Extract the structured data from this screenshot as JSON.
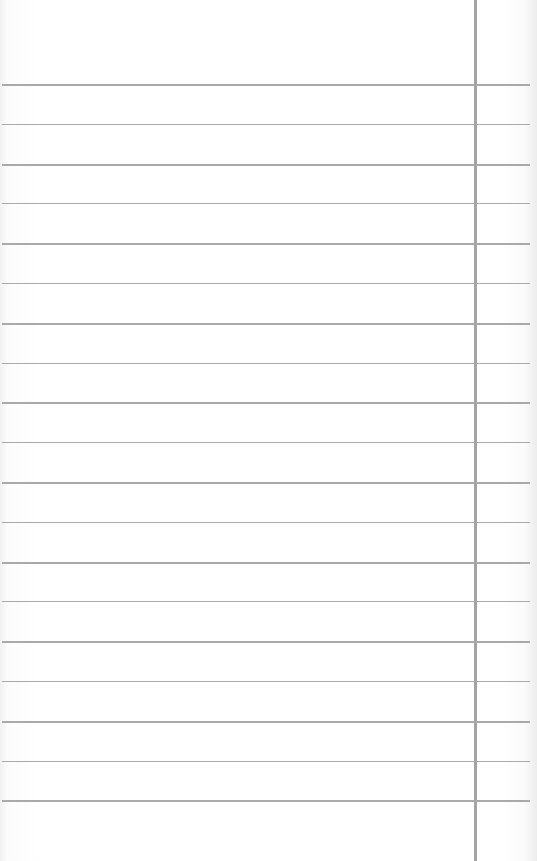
{
  "paper": {
    "type": "lined-paper",
    "background_color": "#ffffff",
    "rule_color": "#a9a9a9",
    "margin_line_color": "#a4a4a4",
    "margin_line_x": 474,
    "first_rule_y": 84,
    "rule_spacing": 39.8,
    "rule_count": 19
  }
}
